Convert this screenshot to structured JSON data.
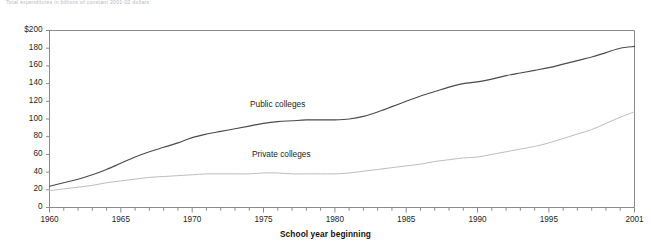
{
  "caption": {
    "text": "Total expenditures in billions of constant 2001-02 dollars"
  },
  "axis_title": {
    "x": "School year beginning"
  },
  "series_labels": {
    "public": "Public colleges",
    "private": "Private colleges"
  },
  "colors": {
    "public_line": "#4a4a4a",
    "private_line": "#bdbdbd",
    "axis": "#8a8a8a",
    "text": "#1d1d1d",
    "background": "#ffffff"
  },
  "chart_data": {
    "type": "line",
    "title": "",
    "xlabel": "School year beginning",
    "ylabel": "",
    "xlim": [
      1960,
      2001
    ],
    "ylim": [
      0,
      200
    ],
    "grid": false,
    "legend": "inline-labels",
    "ytick_labels": [
      "0",
      "20",
      "40",
      "60",
      "80",
      "100",
      "120",
      "140",
      "160",
      "180",
      "$200"
    ],
    "ytick_values": [
      0,
      20,
      40,
      60,
      80,
      100,
      120,
      140,
      160,
      180,
      200
    ],
    "xtick_labels": [
      "1960",
      "1965",
      "1970",
      "1975",
      "1980",
      "1985",
      "1990",
      "1995",
      "2001"
    ],
    "xtick_values": [
      1960,
      1965,
      1970,
      1975,
      1980,
      1985,
      1990,
      1995,
      2001
    ],
    "x_minor_tick_interval": 1,
    "x": [
      1960,
      1961,
      1962,
      1963,
      1964,
      1965,
      1966,
      1967,
      1968,
      1969,
      1970,
      1971,
      1972,
      1973,
      1974,
      1975,
      1976,
      1977,
      1978,
      1979,
      1980,
      1981,
      1982,
      1983,
      1984,
      1985,
      1986,
      1987,
      1988,
      1989,
      1990,
      1991,
      1992,
      1993,
      1994,
      1995,
      1996,
      1997,
      1998,
      1999,
      2000,
      2001
    ],
    "series": [
      {
        "name": "Public colleges",
        "values": [
          24,
          28,
          32,
          37,
          43,
          50,
          57,
          63,
          68,
          73,
          79,
          83,
          86,
          89,
          92,
          95,
          97,
          98,
          99,
          99,
          99,
          100,
          103,
          108,
          114,
          120,
          126,
          131,
          136,
          140,
          142,
          145,
          149,
          152,
          155,
          158,
          162,
          166,
          170,
          175,
          180,
          182
        ]
      },
      {
        "name": "Private colleges",
        "values": [
          19,
          21,
          23,
          25,
          28,
          30,
          32,
          34,
          35,
          36,
          37,
          38,
          38,
          38,
          38,
          39,
          39,
          38,
          38,
          38,
          38,
          39,
          41,
          43,
          45,
          47,
          49,
          52,
          54,
          56,
          57,
          60,
          63,
          66,
          69,
          73,
          78,
          83,
          88,
          95,
          102,
          108
        ]
      }
    ]
  }
}
